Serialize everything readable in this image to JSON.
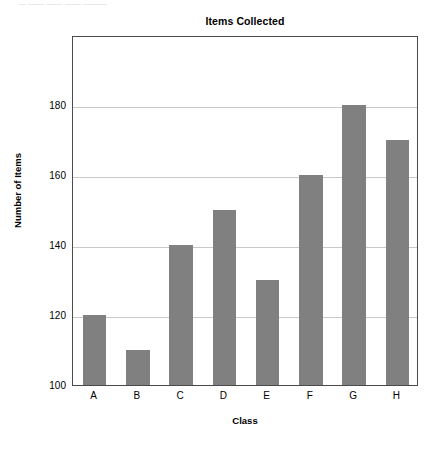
{
  "chart_data": {
    "type": "bar",
    "title": "Items Collected",
    "xlabel": "Class",
    "ylabel": "Number of Items",
    "categories": [
      "A",
      "B",
      "C",
      "D",
      "E",
      "F",
      "G",
      "H"
    ],
    "values": [
      120,
      110,
      140,
      150,
      130,
      160,
      180,
      170
    ],
    "ylim": [
      100,
      200
    ],
    "yticks": [
      100,
      120,
      140,
      160,
      180
    ],
    "ytick_labels": [
      "100",
      "120",
      "140",
      "160",
      "180"
    ],
    "grid": "horizontal",
    "legend": "none",
    "bar_color": "#808080",
    "grid_color": "#c9c9c9",
    "axis_color": "#4a4a4a",
    "background": "#ffffff"
  },
  "artifacts": {
    "top_clipped_text": "— —— —— —— ———"
  }
}
